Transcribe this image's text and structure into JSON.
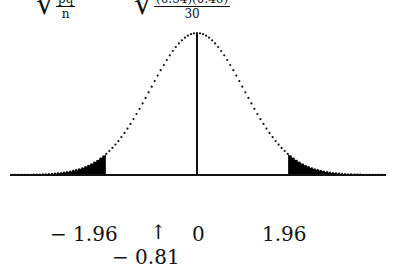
{
  "formula": {
    "left_numerator": "pq",
    "left_denominator": "n",
    "right_numerator": "(0.54)(0.46)",
    "right_denominator": "30"
  },
  "labels": {
    "neg_critical": "− 1.96",
    "arrow": "↑",
    "center": "0",
    "pos_critical": "1.96",
    "test_stat": "− 0.81"
  },
  "chart_data": {
    "type": "area",
    "x_range": [
      -3.5,
      3.5
    ],
    "critical_values": [
      -1.96,
      1.96
    ],
    "center": 0,
    "test_statistic": -0.81,
    "shaded_regions": [
      "x <= -1.96",
      "x >= 1.96"
    ],
    "tick_labels": [
      "-1.96",
      "-0.81",
      "0",
      "1.96"
    ]
  }
}
